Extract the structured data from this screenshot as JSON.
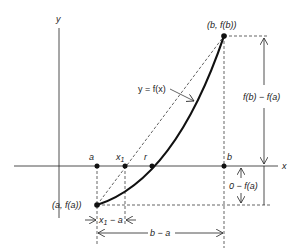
{
  "diagram": {
    "type": "secant-method-illustration",
    "axes": {
      "x_label": "x",
      "y_label": "y"
    },
    "points": {
      "a": "a",
      "x1": "x",
      "x1_sub": "1",
      "r": "r",
      "b": "b",
      "start": "(a, f(a))",
      "end": "(b, f(b))"
    },
    "curve_label": "y = f(x)",
    "dimensions": {
      "rise": "f(b) − f(a)",
      "depth": "0 − f(a)",
      "x1_minus_a_x": "x",
      "x1_minus_a_sub": "1",
      "x1_minus_a_rest": " − a",
      "b_minus_a": "b − a"
    },
    "colors": {
      "ink": "#222222",
      "background": "#ffffff"
    }
  }
}
